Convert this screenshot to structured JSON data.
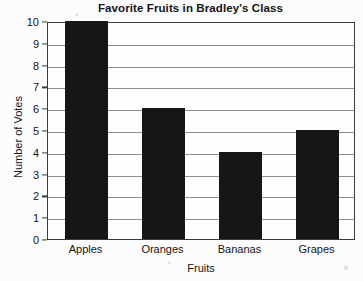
{
  "chart_data": {
    "type": "bar",
    "title": "Favorite Fruits in Bradley's Class",
    "xlabel": "Fruits",
    "ylabel": "Number of Votes",
    "categories": [
      "Apples",
      "Oranges",
      "Bananas",
      "Grapes"
    ],
    "values": [
      10,
      6,
      4,
      5
    ],
    "ylim": [
      0,
      10
    ],
    "ytick_labels": [
      "10",
      "9",
      "8",
      "7",
      "6",
      "5",
      "4",
      "3",
      "2",
      "1",
      "0"
    ],
    "ytick_values": [
      10,
      9,
      8,
      7,
      6,
      5,
      4,
      3,
      2,
      1,
      0
    ],
    "grid": true,
    "legend": "none",
    "bar_color": "#161616",
    "grid_color": "#8e8e8e",
    "frame_color": "#3a3a3a",
    "background_color": "#fcfcfc"
  }
}
